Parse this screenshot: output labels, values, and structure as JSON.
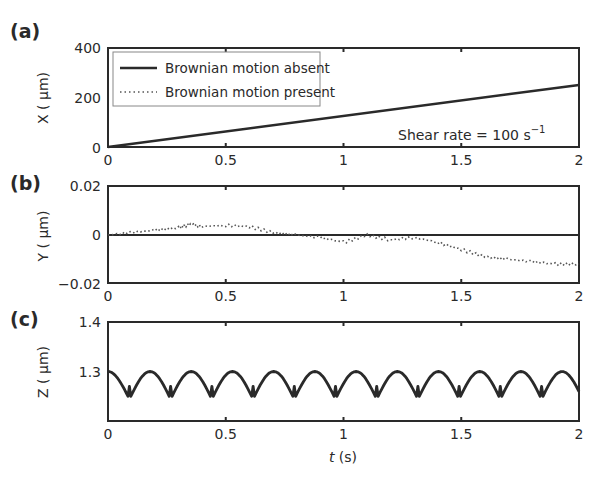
{
  "figure": {
    "xlabel": "t (s)",
    "xlabel_italic": "t",
    "xlabel_unit": " (s)",
    "xticks": [
      "0",
      "0.5",
      "1",
      "1.5",
      "2"
    ]
  },
  "panels": [
    {
      "label": "(a)",
      "ylabel": "X ( µm)",
      "yticks": [
        "400",
        "200",
        "0"
      ],
      "legend": [
        {
          "label": "Brownian motion absent",
          "style": "solid"
        },
        {
          "label": "Brownian motion present",
          "style": "dotted"
        }
      ],
      "annotation": "Shear rate = 100 s",
      "annotation_sup": "−1"
    },
    {
      "label": "(b)",
      "ylabel": "Y ( µm)",
      "yticks": [
        "0.02",
        "0",
        "−0.02"
      ]
    },
    {
      "label": "(c)",
      "ylabel": "Z ( µm)",
      "yticks": [
        "1.4",
        "1.3",
        ""
      ]
    }
  ],
  "chart_data": [
    {
      "type": "line",
      "title": "(a)",
      "xlabel": "t (s)",
      "ylabel": "X (µm)",
      "xlim": [
        0,
        2
      ],
      "ylim": [
        0,
        400
      ],
      "legend_position": "upper left",
      "annotation": "Shear rate = 100 s^-1",
      "series": [
        {
          "name": "Brownian motion absent",
          "style": "solid",
          "x": [
            0,
            0.5,
            1,
            1.5,
            2
          ],
          "y": [
            0,
            62,
            125,
            188,
            250
          ]
        },
        {
          "name": "Brownian motion present",
          "style": "dotted",
          "x": [
            0,
            0.5,
            1,
            1.5,
            2
          ],
          "y": [
            0,
            62,
            125,
            188,
            250
          ]
        }
      ]
    },
    {
      "type": "line",
      "title": "(b)",
      "xlabel": "t (s)",
      "ylabel": "Y (µm)",
      "xlim": [
        0,
        2
      ],
      "ylim": [
        -0.02,
        0.02
      ],
      "series": [
        {
          "name": "Brownian motion absent",
          "style": "solid",
          "x": [
            0,
            2
          ],
          "y": [
            0,
            0
          ]
        },
        {
          "name": "Brownian motion present",
          "style": "dotted",
          "x": [
            0,
            0.1,
            0.2,
            0.3,
            0.35,
            0.4,
            0.5,
            0.6,
            0.7,
            0.8,
            0.9,
            1.0,
            1.1,
            1.2,
            1.3,
            1.4,
            1.5,
            1.6,
            1.7,
            1.8,
            1.9,
            2.0
          ],
          "y": [
            0,
            0.001,
            0.002,
            0.003,
            0.0045,
            0.0035,
            0.004,
            0.0035,
            0.001,
            0.0,
            -0.001,
            -0.003,
            0.0,
            -0.002,
            -0.001,
            -0.003,
            -0.006,
            -0.009,
            -0.01,
            -0.011,
            -0.012,
            -0.012
          ]
        }
      ]
    },
    {
      "type": "line",
      "title": "(c)",
      "xlabel": "t (s)",
      "ylabel": "Z (µm)",
      "xlim": [
        0,
        2
      ],
      "ylim": [
        1.2,
        1.4
      ],
      "series": [
        {
          "name": "Z trajectory (periodic rolling)",
          "style": "solid",
          "period_s": 0.175,
          "max": 1.3,
          "min": 1.25,
          "cusp_times": [
            0.085,
            0.26,
            0.435,
            0.61,
            0.785,
            0.96,
            1.135,
            1.31,
            1.485,
            1.66,
            1.835
          ]
        }
      ]
    }
  ]
}
